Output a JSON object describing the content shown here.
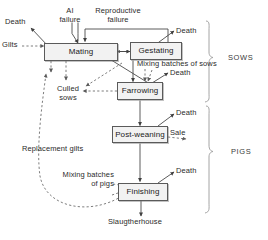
{
  "diagram": {
    "nodes": [
      {
        "id": "mating",
        "label": "Mating"
      },
      {
        "id": "gestating",
        "label": "Gestating"
      },
      {
        "id": "farrowing",
        "label": "Farrowing"
      },
      {
        "id": "postweaning",
        "label": "Post-weaning"
      },
      {
        "id": "finishing",
        "label": "Finishing"
      }
    ],
    "labels": [
      {
        "id": "ai-failure",
        "text": "AI",
        "text2": "failure"
      },
      {
        "id": "reproductive-failure",
        "text": "Reproductive",
        "text2": "failure"
      },
      {
        "id": "death-mating",
        "text": "Death"
      },
      {
        "id": "gilts",
        "text": "Gilts"
      },
      {
        "id": "death-gestating",
        "text": "Death"
      },
      {
        "id": "mixing-sows",
        "text": "Mixing batches of sows"
      },
      {
        "id": "death-farrowing",
        "text": "Death"
      },
      {
        "id": "culled-sows",
        "text": "Culled",
        "text2": "sows"
      },
      {
        "id": "death-postweaning",
        "text": "Death"
      },
      {
        "id": "sale",
        "text": "Sale"
      },
      {
        "id": "replacement-gilts",
        "text": "Replacement gilts"
      },
      {
        "id": "mixing-pigs",
        "text": "Mixing batches",
        "text2": "of pigs"
      },
      {
        "id": "death-finishing",
        "text": "Death"
      },
      {
        "id": "slaughterhouse",
        "text": "Slaugtherhouse"
      }
    ],
    "groups": [
      {
        "id": "sows",
        "label": "SOWS"
      },
      {
        "id": "pigs",
        "label": "PIGS"
      }
    ],
    "colors": {
      "node_fill": "#f2f2f2",
      "node_border": "#5a5a5a",
      "solid_line": "#4a4a4a",
      "dashed_line": "#6e6e6e",
      "bracket": "#9a9a9a",
      "text": "#2b2b2b",
      "background": "#ffffff"
    }
  }
}
